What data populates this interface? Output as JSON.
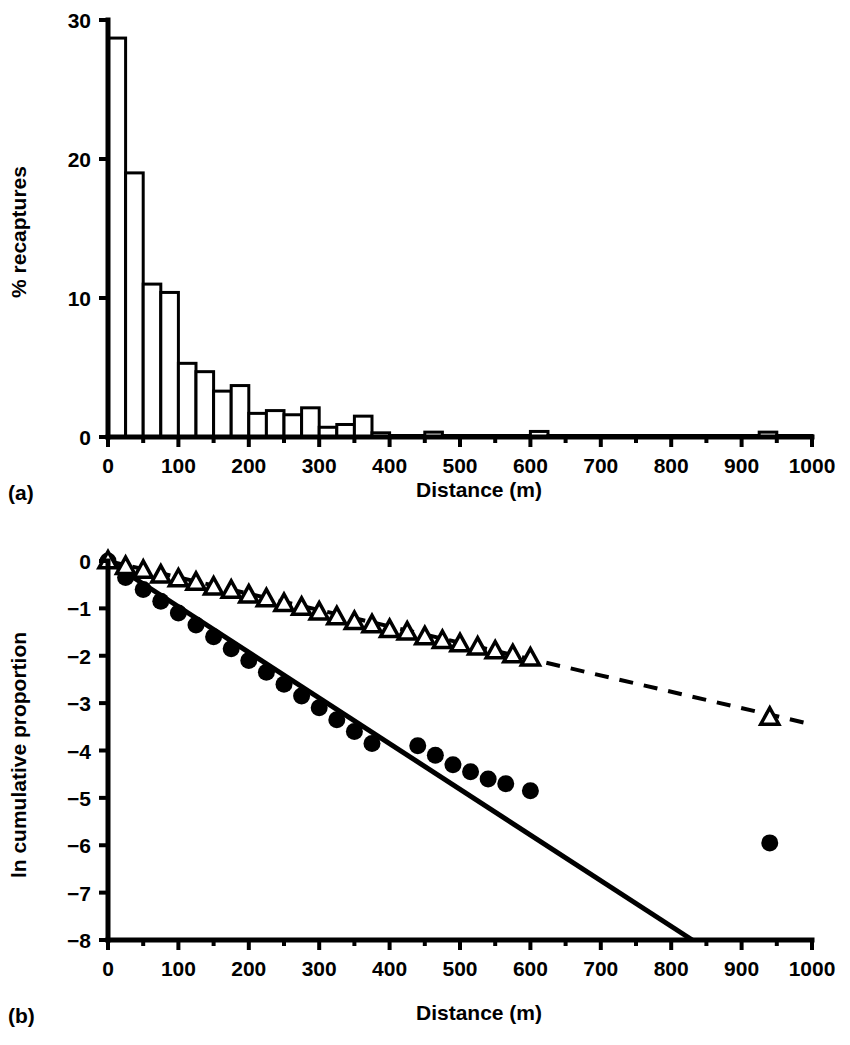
{
  "figure": {
    "panel_a_label": "(a)",
    "panel_b_label": "(b)"
  },
  "chart_data": [
    {
      "panel": "(a)",
      "type": "bar",
      "title": "",
      "xlabel": "Distance (m)",
      "ylabel": "% recaptures",
      "xlim": [
        0,
        1000
      ],
      "ylim": [
        0,
        30
      ],
      "xticks": [
        0,
        100,
        200,
        300,
        400,
        500,
        600,
        700,
        800,
        900,
        1000
      ],
      "xtick_labels": [
        "0",
        "100",
        "200",
        "300",
        "400",
        "500",
        "600",
        "700",
        "800",
        "900",
        "1000"
      ],
      "minor_xtick_step": 50,
      "yticks": [
        0,
        10,
        20,
        30
      ],
      "ytick_labels": [
        "0",
        "10",
        "20",
        "30"
      ],
      "grid": false,
      "bin_width": 25,
      "bin_starts": [
        0,
        25,
        50,
        75,
        100,
        125,
        150,
        175,
        200,
        225,
        250,
        275,
        300,
        325,
        350,
        375,
        400,
        425,
        450,
        475,
        500,
        525,
        550,
        575,
        600,
        625,
        650,
        675,
        700,
        725,
        750,
        775,
        800,
        825,
        850,
        875,
        900,
        925,
        950,
        975
      ],
      "values": [
        28.7,
        19.0,
        11.0,
        10.4,
        5.3,
        4.7,
        3.3,
        3.7,
        1.7,
        1.9,
        1.6,
        2.1,
        0.7,
        0.9,
        1.5,
        0.3,
        0.0,
        0.0,
        0.35,
        0.0,
        0.0,
        0.0,
        0.0,
        0.0,
        0.4,
        0.0,
        0.0,
        0.0,
        0.0,
        0.0,
        0.0,
        0.0,
        0.0,
        0.0,
        0.0,
        0.0,
        0.0,
        0.35,
        0.0,
        0.0
      ]
    },
    {
      "panel": "(b)",
      "type": "scatter",
      "title": "",
      "xlabel": "Distance (m)",
      "ylabel": "ln cumulative proportion",
      "xlim": [
        0,
        1000
      ],
      "ylim": [
        -8,
        0
      ],
      "xticks": [
        0,
        100,
        200,
        300,
        400,
        500,
        600,
        700,
        800,
        900,
        1000
      ],
      "xtick_labels": [
        "0",
        "100",
        "200",
        "300",
        "400",
        "500",
        "600",
        "700",
        "800",
        "900",
        "1000"
      ],
      "minor_xtick_step": 50,
      "yticks": [
        0,
        -1,
        -2,
        -3,
        -4,
        -5,
        -6,
        -7,
        -8
      ],
      "ytick_labels": [
        "0",
        "−1",
        "−2",
        "−3",
        "−4",
        "−5",
        "−6",
        "−7",
        "−8"
      ],
      "grid": false,
      "legend": "none",
      "series": [
        {
          "name": "filled-circles",
          "marker": "filled-circle",
          "x": [
            0,
            25,
            50,
            75,
            100,
            125,
            150,
            175,
            200,
            225,
            250,
            275,
            300,
            325,
            350,
            375,
            440,
            465,
            490,
            515,
            540,
            565,
            600,
            940
          ],
          "y": [
            0.0,
            -0.35,
            -0.6,
            -0.85,
            -1.1,
            -1.35,
            -1.6,
            -1.85,
            -2.1,
            -2.35,
            -2.6,
            -2.85,
            -3.1,
            -3.35,
            -3.6,
            -3.85,
            -3.9,
            -4.1,
            -4.3,
            -4.45,
            -4.6,
            -4.7,
            -4.85,
            -5.95
          ]
        },
        {
          "name": "open-triangles",
          "marker": "open-triangle",
          "x": [
            0,
            25,
            50,
            75,
            100,
            125,
            150,
            175,
            200,
            225,
            250,
            275,
            300,
            325,
            350,
            375,
            400,
            425,
            450,
            475,
            500,
            525,
            550,
            575,
            600,
            940
          ],
          "y": [
            0.0,
            -0.12,
            -0.2,
            -0.3,
            -0.38,
            -0.45,
            -0.55,
            -0.62,
            -0.72,
            -0.8,
            -0.9,
            -0.98,
            -1.08,
            -1.18,
            -1.28,
            -1.35,
            -1.45,
            -1.5,
            -1.6,
            -1.68,
            -1.75,
            -1.82,
            -1.9,
            -1.98,
            -2.05,
            -3.3
          ]
        }
      ],
      "fit_lines": [
        {
          "name": "solid-regression-circles",
          "style": "solid",
          "x": [
            0,
            830
          ],
          "y": [
            0.0,
            -8.0
          ]
        },
        {
          "name": "dashed-regression-triangles",
          "style": "dashed",
          "x": [
            0,
            1000
          ],
          "y": [
            0.0,
            -3.45
          ]
        }
      ]
    }
  ]
}
